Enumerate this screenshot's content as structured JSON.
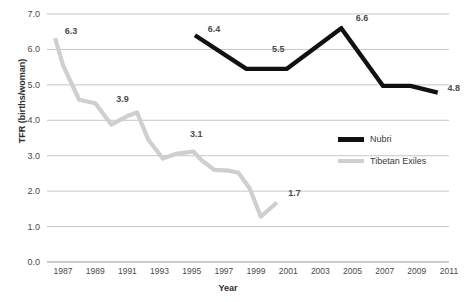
{
  "chart_data": {
    "type": "line",
    "title": "",
    "xlabel": "Year",
    "ylabel": "TFR (births/woman)",
    "xlim": [
      1986.0,
      2011.0
    ],
    "ylim": [
      0.0,
      7.0
    ],
    "grid": "horizontal",
    "legend_position": "center-right",
    "x_ticks": [
      "1987",
      "1989",
      "1991",
      "1993",
      "1995",
      "1997",
      "1999",
      "2001",
      "2003",
      "2005",
      "2007",
      "2009",
      "2011"
    ],
    "y_ticks": [
      "0.0",
      "1.0",
      "2.0",
      "3.0",
      "4.0",
      "5.0",
      "6.0",
      "7.0"
    ],
    "series": [
      {
        "name": "Nubri",
        "color": "#111111",
        "x": [
          1995.2,
          1998.4,
          2000.9,
          2004.3,
          2006.9,
          2008.6,
          2010.3
        ],
        "values": [
          6.4,
          5.45,
          5.45,
          6.6,
          4.97,
          4.97,
          4.78
        ],
        "labels": [
          {
            "text": "6.4",
            "x": 1996.0,
            "y": 6.4
          },
          {
            "text": "5.5",
            "x": 2000.0,
            "y": 5.85
          },
          {
            "text": "6.6",
            "x": 2005.2,
            "y": 6.72
          },
          {
            "text": "4.8",
            "x": 2010.9,
            "y": 4.73
          }
        ]
      },
      {
        "name": "Tibetan Exiles",
        "color": "#cfcfcf",
        "x": [
          1986.5,
          1987.0,
          1988.0,
          1989.0,
          1990.0,
          1991.0,
          1991.6,
          1992.3,
          1993.2,
          1994.0,
          1995.1,
          1995.6,
          1996.4,
          1997.3,
          1997.9,
          1998.6,
          1999.3,
          2000.3
        ],
        "values": [
          6.32,
          5.55,
          4.58,
          4.48,
          3.88,
          4.12,
          4.22,
          3.45,
          2.92,
          3.05,
          3.12,
          2.88,
          2.6,
          2.58,
          2.52,
          2.08,
          1.28,
          1.68
        ],
        "labels": [
          {
            "text": "6.3",
            "x": 1987.1,
            "y": 6.35
          },
          {
            "text": "3.9",
            "x": 1990.3,
            "y": 4.42
          },
          {
            "text": "3.1",
            "x": 1994.9,
            "y": 3.45
          },
          {
            "text": "1.7",
            "x": 2001.0,
            "y": 1.78
          }
        ]
      }
    ]
  },
  "legend": {
    "items": [
      {
        "label": "Nubri",
        "color": "#111111"
      },
      {
        "label": "Tibetan Exiles",
        "color": "#cfcfcf"
      }
    ]
  },
  "axes": {
    "y_title": "TFR (births/woman)",
    "x_title": "Year"
  }
}
